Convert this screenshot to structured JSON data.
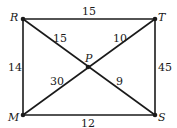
{
  "diagram": {
    "type": "graph",
    "vertices": [
      {
        "id": "R",
        "label": "R",
        "x": 23,
        "y": 19
      },
      {
        "id": "T",
        "label": "T",
        "x": 155,
        "y": 19
      },
      {
        "id": "M",
        "label": "M",
        "x": 23,
        "y": 115
      },
      {
        "id": "S",
        "label": "S",
        "x": 155,
        "y": 115
      },
      {
        "id": "P",
        "label": "P",
        "x": 88,
        "y": 67
      }
    ],
    "edges": [
      {
        "from": "R",
        "to": "T",
        "weight": "15"
      },
      {
        "from": "R",
        "to": "M",
        "weight": "14"
      },
      {
        "from": "T",
        "to": "S",
        "weight": "45"
      },
      {
        "from": "M",
        "to": "S",
        "weight": "12"
      },
      {
        "from": "R",
        "to": "P",
        "weight": "15"
      },
      {
        "from": "T",
        "to": "P",
        "weight": "10"
      },
      {
        "from": "M",
        "to": "P",
        "weight": "30"
      },
      {
        "from": "S",
        "to": "P",
        "weight": "9"
      }
    ],
    "colors": {
      "line": "#1a1a1a",
      "background": "#ffffff"
    }
  }
}
